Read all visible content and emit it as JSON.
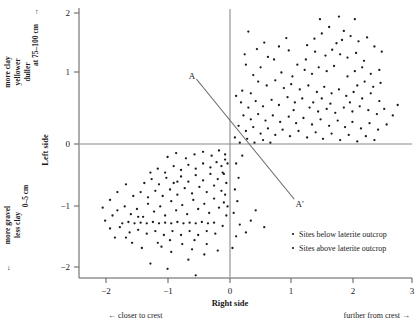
{
  "chart_data": {
    "type": "scatter",
    "title": "",
    "xlabel": "Right side",
    "ylabel": "Left side",
    "xlim": [
      -2.35,
      3.15
    ],
    "ylim": [
      -2.35,
      2.15
    ],
    "xticks": [
      -2,
      -1,
      0,
      1,
      2,
      3
    ],
    "xtick_labels": [
      "−2",
      "−1",
      "0",
      "1",
      "2",
      "3"
    ],
    "yticks": [
      -2,
      -1,
      0,
      1,
      2
    ],
    "ytick_labels": [
      "−2",
      "−1",
      "0",
      "1",
      "2"
    ],
    "grid": false,
    "legend_position": "bottom-right",
    "legend": [
      {
        "marker": "dot",
        "label": "Sites below laterite outcrop"
      },
      {
        "marker": "dot",
        "label": "Sites above laterite outcrop"
      }
    ],
    "annotations": [
      {
        "name": "axis-line-A",
        "text": "A",
        "x": -0.62,
        "y": 1.05
      },
      {
        "name": "axis-line-A-prime",
        "text": "A′",
        "x": 1.14,
        "y": -0.92
      }
    ],
    "reference_lines": [
      {
        "name": "A-A-prime",
        "x1": -0.55,
        "y1": 1.0,
        "x2": 1.05,
        "y2": -0.85
      },
      {
        "name": "zero-horizontal",
        "x1": -2.35,
        "y1": 0,
        "x2": 3.15,
        "y2": 0
      },
      {
        "name": "zero-vertical",
        "x1": 0,
        "y1": -2.35,
        "x2": 0,
        "y2": 2.15
      }
    ],
    "axis_side_labels": {
      "upper": [
        "at 75–100 cm",
        "more clay",
        "yellower",
        "duller"
      ],
      "upper_arrow": "→",
      "lower": [
        "0–5 cm",
        "more gravel",
        "less clay"
      ],
      "lower_arrow": "←"
    },
    "x_direction_labels": {
      "left": "← closer to crest",
      "right": "further from crest →"
    },
    "series": [
      {
        "name": "Sites below laterite outcrop",
        "marker": "dot",
        "points": [
          [
            0.3,
            1.73
          ],
          [
            1.47,
            1.92
          ],
          [
            1.78,
            1.96
          ],
          [
            2.04,
            1.92
          ],
          [
            1.62,
            1.8
          ],
          [
            1.86,
            1.74
          ],
          [
            1.97,
            1.66
          ],
          [
            1.83,
            1.6
          ],
          [
            1.74,
            1.55
          ],
          [
            2.1,
            1.58
          ],
          [
            0.92,
            1.63
          ],
          [
            1.24,
            1.3
          ],
          [
            0.62,
            1.34
          ],
          [
            0.72,
            1.3
          ],
          [
            1.1,
            1.22
          ],
          [
            1.39,
            1.42
          ],
          [
            1.56,
            1.36
          ],
          [
            1.67,
            1.45
          ],
          [
            1.8,
            1.38
          ],
          [
            1.92,
            1.33
          ],
          [
            2.06,
            1.4
          ],
          [
            2.19,
            1.28
          ],
          [
            1.45,
            1.18
          ],
          [
            1.58,
            1.12
          ],
          [
            1.7,
            1.2
          ],
          [
            1.34,
            1.08
          ],
          [
            1.22,
            1.14
          ],
          [
            1.02,
            1.04
          ],
          [
            0.84,
            1.1
          ],
          [
            0.5,
            1.18
          ],
          [
            0.38,
            1.06
          ],
          [
            0.26,
            1.22
          ],
          [
            0.46,
            0.96
          ],
          [
            0.6,
            0.9
          ],
          [
            0.74,
            0.98
          ],
          [
            0.88,
            0.86
          ],
          [
            1.0,
            0.92
          ],
          [
            1.14,
            0.84
          ],
          [
            1.28,
            0.9
          ],
          [
            1.42,
            0.8
          ],
          [
            1.54,
            0.88
          ],
          [
            1.66,
            0.78
          ],
          [
            1.78,
            0.84
          ],
          [
            1.9,
            0.74
          ],
          [
            2.02,
            0.8
          ],
          [
            2.16,
            0.7
          ],
          [
            2.3,
            0.78
          ],
          [
            2.44,
            0.66
          ],
          [
            1.18,
            0.7
          ],
          [
            1.06,
            0.64
          ],
          [
            0.94,
            0.72
          ],
          [
            0.8,
            0.6
          ],
          [
            0.68,
            0.68
          ],
          [
            0.54,
            0.58
          ],
          [
            0.42,
            0.66
          ],
          [
            0.3,
            0.56
          ],
          [
            0.18,
            0.64
          ],
          [
            0.22,
            0.44
          ],
          [
            0.34,
            0.38
          ],
          [
            0.46,
            0.46
          ],
          [
            0.58,
            0.36
          ],
          [
            0.7,
            0.44
          ],
          [
            0.82,
            0.34
          ],
          [
            0.96,
            0.42
          ],
          [
            1.08,
            0.32
          ],
          [
            1.2,
            0.4
          ],
          [
            1.34,
            0.3
          ],
          [
            1.48,
            0.38
          ],
          [
            1.62,
            0.28
          ],
          [
            1.76,
            0.36
          ],
          [
            1.88,
            0.26
          ],
          [
            2.0,
            0.34
          ],
          [
            2.14,
            0.24
          ],
          [
            2.28,
            0.32
          ],
          [
            2.42,
            0.22
          ],
          [
            2.56,
            0.3
          ],
          [
            0.14,
            0.28
          ],
          [
            0.26,
            0.2
          ],
          [
            0.38,
            0.26
          ],
          [
            0.5,
            0.16
          ],
          [
            0.62,
            0.24
          ],
          [
            0.74,
            0.14
          ],
          [
            0.86,
            0.22
          ],
          [
            0.98,
            0.12
          ],
          [
            1.12,
            0.2
          ],
          [
            1.26,
            0.1
          ],
          [
            1.4,
            0.18
          ],
          [
            1.52,
            0.08
          ],
          [
            1.66,
            0.16
          ],
          [
            1.8,
            0.06
          ],
          [
            1.94,
            0.14
          ],
          [
            2.08,
            0.04
          ],
          [
            2.22,
            0.12
          ],
          [
            2.36,
            0.06
          ],
          [
            0.08,
            0.1
          ],
          [
            0.16,
            0.02
          ],
          [
            0.28,
            0.08
          ],
          [
            0.4,
            0.02
          ],
          [
            0.54,
            0.06
          ],
          [
            0.66,
            0.02
          ],
          [
            1.04,
            0.52
          ],
          [
            1.3,
            0.56
          ],
          [
            1.44,
            0.5
          ],
          [
            1.58,
            0.54
          ],
          [
            1.72,
            0.48
          ],
          [
            1.86,
            0.56
          ],
          [
            2.0,
            0.5
          ],
          [
            2.12,
            0.58
          ],
          [
            2.26,
            0.52
          ],
          [
            2.4,
            0.46
          ],
          [
            2.52,
            0.54
          ],
          [
            2.66,
            0.44
          ],
          [
            2.74,
            0.6
          ],
          [
            0.2,
            0.82
          ],
          [
            0.1,
            0.74
          ],
          [
            0.34,
            0.78
          ],
          [
            1.36,
            0.64
          ],
          [
            1.5,
            0.7
          ],
          [
            1.64,
            0.62
          ],
          [
            1.96,
            0.64
          ],
          [
            2.08,
            0.9
          ],
          [
            2.2,
            0.96
          ],
          [
            2.34,
            0.88
          ],
          [
            2.46,
            0.94
          ],
          [
            1.26,
            1.52
          ],
          [
            1.38,
            1.62
          ],
          [
            1.5,
            1.7
          ],
          [
            0.96,
            1.44
          ],
          [
            0.8,
            1.5
          ],
          [
            2.24,
            1.64
          ],
          [
            2.36,
            1.5
          ],
          [
            2.48,
            1.42
          ],
          [
            2.16,
            1.18
          ],
          [
            2.3,
            1.08
          ],
          [
            2.44,
            1.14
          ],
          [
            0.44,
            1.46
          ],
          [
            0.56,
            1.56
          ],
          [
            0.24,
            1.38
          ],
          [
            1.92,
            1.04
          ],
          [
            2.04,
            1.12
          ]
        ]
      },
      {
        "name": "Sites above laterite outcrop",
        "marker": "dot",
        "points": [
          [
            -1.84,
            -1.02
          ],
          [
            -1.72,
            -0.96
          ],
          [
            -1.62,
            -1.08
          ],
          [
            -1.52,
            -1.0
          ],
          [
            -1.42,
            -1.12
          ],
          [
            -1.34,
            -0.92
          ],
          [
            -1.24,
            -1.04
          ],
          [
            -1.14,
            -0.96
          ],
          [
            -1.06,
            -1.1
          ],
          [
            -0.96,
            -0.88
          ],
          [
            -0.88,
            -1.02
          ],
          [
            -0.78,
            -0.94
          ],
          [
            -0.7,
            -1.08
          ],
          [
            -0.6,
            -0.86
          ],
          [
            -0.52,
            -1.0
          ],
          [
            -0.42,
            -0.92
          ],
          [
            -0.34,
            -1.06
          ],
          [
            -0.26,
            -0.84
          ],
          [
            -0.18,
            -0.98
          ],
          [
            -0.1,
            -0.9
          ],
          [
            -1.76,
            -1.22
          ],
          [
            -1.66,
            -1.2
          ],
          [
            -1.56,
            -1.22
          ],
          [
            -1.46,
            -1.21
          ],
          [
            -1.36,
            -1.22
          ],
          [
            -1.26,
            -1.2
          ],
          [
            -1.16,
            -1.22
          ],
          [
            -1.06,
            -1.21
          ],
          [
            -0.96,
            -1.22
          ],
          [
            -0.86,
            -1.2
          ],
          [
            -0.76,
            -1.22
          ],
          [
            -0.66,
            -1.21
          ],
          [
            -0.56,
            -1.22
          ],
          [
            -0.46,
            -1.2
          ],
          [
            -0.36,
            -1.22
          ],
          [
            -0.26,
            -1.21
          ],
          [
            -1.58,
            -0.8
          ],
          [
            -1.46,
            -0.74
          ],
          [
            -1.34,
            -0.82
          ],
          [
            -1.22,
            -0.72
          ],
          [
            -1.1,
            -0.8
          ],
          [
            -0.98,
            -0.7
          ],
          [
            -0.86,
            -0.78
          ],
          [
            -0.74,
            -0.68
          ],
          [
            -0.62,
            -0.76
          ],
          [
            -0.5,
            -0.66
          ],
          [
            -0.38,
            -0.74
          ],
          [
            -0.26,
            -0.64
          ],
          [
            -0.14,
            -0.72
          ],
          [
            -1.4,
            -0.6
          ],
          [
            -1.28,
            -0.54
          ],
          [
            -1.16,
            -0.62
          ],
          [
            -1.04,
            -0.52
          ],
          [
            -0.92,
            -0.6
          ],
          [
            -0.8,
            -0.5
          ],
          [
            -0.68,
            -0.58
          ],
          [
            -0.56,
            -0.48
          ],
          [
            -0.44,
            -0.56
          ],
          [
            -0.32,
            -0.46
          ],
          [
            -0.2,
            -0.54
          ],
          [
            -0.12,
            -0.44
          ],
          [
            -0.92,
            -0.34
          ],
          [
            -0.8,
            -0.4
          ],
          [
            -0.68,
            -0.32
          ],
          [
            -0.56,
            -0.38
          ],
          [
            -0.44,
            -0.3
          ],
          [
            -0.32,
            -0.36
          ],
          [
            -0.22,
            -0.28
          ],
          [
            -0.14,
            -0.34
          ],
          [
            -0.08,
            -0.24
          ],
          [
            -1.64,
            -1.36
          ],
          [
            -1.5,
            -1.32
          ],
          [
            -1.36,
            -1.38
          ],
          [
            -1.22,
            -1.34
          ],
          [
            -1.08,
            -1.4
          ],
          [
            -0.94,
            -1.34
          ],
          [
            -0.8,
            -1.4
          ],
          [
            -0.66,
            -1.34
          ],
          [
            -0.52,
            -1.4
          ],
          [
            -0.38,
            -1.34
          ],
          [
            -0.24,
            -1.38
          ],
          [
            -1.18,
            -1.52
          ],
          [
            -0.98,
            -1.48
          ],
          [
            -0.78,
            -1.54
          ],
          [
            -0.58,
            -1.48
          ],
          [
            -0.38,
            -1.54
          ],
          [
            -1.3,
            -0.44
          ],
          [
            -1.18,
            -0.38
          ],
          [
            -1.06,
            -0.44
          ],
          [
            -0.2,
            -1.64
          ],
          [
            -0.42,
            -1.7
          ],
          [
            -0.62,
            -1.62
          ],
          [
            -1.88,
            -1.44
          ],
          [
            -1.96,
            -1.3
          ],
          [
            -2.04,
            -1.18
          ],
          [
            -1.92,
            -1.1
          ],
          [
            -0.06,
            -1.1
          ],
          [
            -0.04,
            -0.96
          ],
          [
            -0.08,
            -0.78
          ],
          [
            -0.06,
            -0.6
          ],
          [
            -0.1,
            -0.46
          ],
          [
            -0.04,
            -0.3
          ],
          [
            -0.08,
            -0.16
          ],
          [
            -0.12,
            -1.26
          ],
          [
            -1.02,
            -0.2
          ],
          [
            -0.88,
            -0.14
          ],
          [
            -0.72,
            -0.22
          ],
          [
            -0.58,
            -0.16
          ],
          [
            -0.44,
            -0.12
          ],
          [
            -0.3,
            -0.18
          ],
          [
            -0.18,
            -0.1
          ],
          [
            -1.44,
            -1.6
          ],
          [
            -1.6,
            -1.52
          ],
          [
            -0.96,
            -1.66
          ],
          [
            -1.12,
            -1.58
          ],
          [
            -0.68,
            -1.78
          ],
          [
            -0.86,
            -0.58
          ],
          [
            -1.5,
            -1.12
          ],
          [
            -1.7,
            -1.44
          ],
          [
            -1.8,
            -1.28
          ],
          [
            0.1,
            -0.3
          ],
          [
            0.14,
            -0.52
          ],
          [
            0.08,
            -0.7
          ],
          [
            0.12,
            -0.88
          ],
          [
            0.06,
            -1.06
          ],
          [
            0.16,
            -1.24
          ],
          [
            0.1,
            -1.42
          ],
          [
            0.2,
            -0.18
          ],
          [
            0.04,
            -1.6
          ],
          [
            0.26,
            -1.36
          ],
          [
            0.34,
            -1.18
          ],
          [
            0.42,
            -1.02
          ],
          [
            -1.7,
            -0.62
          ],
          [
            -1.84,
            -0.74
          ],
          [
            -1.96,
            -0.86
          ],
          [
            -2.08,
            -0.98
          ],
          [
            -0.56,
            -2.02
          ],
          [
            -1.02,
            -1.92
          ],
          [
            -1.3,
            -1.84
          ],
          [
            0.56,
            -1.28
          ]
        ]
      }
    ]
  }
}
